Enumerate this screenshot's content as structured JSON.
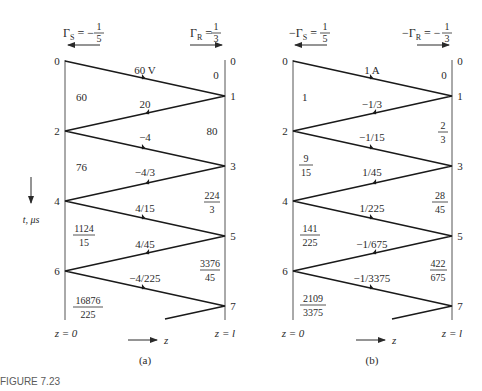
{
  "figure_caption": "FIGURE 7.23",
  "time_axis_label": "t, μs",
  "panels": [
    {
      "id": "a",
      "caption": "(a)",
      "gamma_s_label": "ΓS = − 1/5",
      "gamma_s": {
        "lhs": "Γ",
        "sub": "S",
        "sign": "−",
        "num": "1",
        "den": "5"
      },
      "gamma_r": {
        "lhs": "Γ",
        "sub": "R",
        "sign": "",
        "num": "1",
        "den": "3"
      },
      "z_left": "z = 0",
      "z_right": "z = l",
      "z_arrow": "z",
      "left_ticks": [
        "0",
        "2",
        "4",
        "6"
      ],
      "right_ticks": [
        "0",
        "1",
        "3",
        "5",
        "7"
      ],
      "wave_labels": [
        "60 V",
        "20",
        "−4",
        "−4/3",
        "4/15",
        "4/45",
        "−4/225"
      ],
      "left_values": [
        {
          "num": "60",
          "den": ""
        },
        {
          "num": "76",
          "den": ""
        },
        {
          "num": "1124",
          "den": "15"
        },
        {
          "num": "16876",
          "den": "225"
        }
      ],
      "right_values": [
        {
          "num": "0",
          "den": ""
        },
        {
          "num": "80",
          "den": ""
        },
        {
          "num": "224",
          "den": "3"
        },
        {
          "num": "3376",
          "den": "45"
        }
      ]
    },
    {
      "id": "b",
      "caption": "(b)",
      "gamma_s": {
        "lhs": "−Γ",
        "sub": "S",
        "sign": "",
        "num": "1",
        "den": "5"
      },
      "gamma_r": {
        "lhs": "−Γ",
        "sub": "R",
        "sign": "−",
        "num": "1",
        "den": "3"
      },
      "z_left": "z = 0",
      "z_right": "z = l",
      "z_arrow": "z",
      "left_ticks": [
        "0",
        "2",
        "4",
        "6"
      ],
      "right_ticks": [
        "0",
        "1",
        "3",
        "5",
        "7"
      ],
      "wave_labels": [
        "1 A",
        "−1/3",
        "−1/15",
        "1/45",
        "1/225",
        "−1/675",
        "−1/3375"
      ],
      "left_values": [
        {
          "num": "1",
          "den": ""
        },
        {
          "num": "9",
          "den": "15"
        },
        {
          "num": "141",
          "den": "225"
        },
        {
          "num": "2109",
          "den": "3375"
        }
      ],
      "right_values": [
        {
          "num": "0",
          "den": ""
        },
        {
          "num": "2",
          "den": "3"
        },
        {
          "num": "28",
          "den": "45"
        },
        {
          "num": "422",
          "den": "675"
        }
      ]
    }
  ]
}
